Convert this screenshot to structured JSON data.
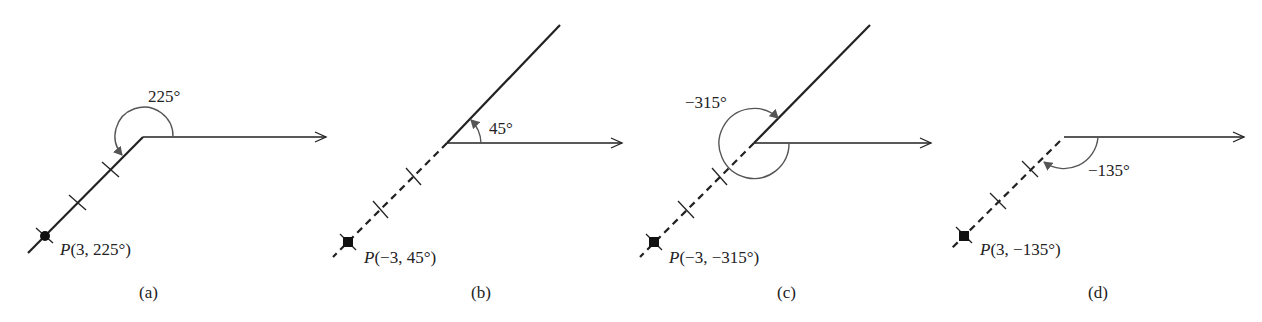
{
  "figure": {
    "panels": [
      {
        "id": "a",
        "caption": "(a)",
        "angle_label": "225°",
        "point_label_prefix": "P",
        "point_label_coords": "(3, 225°)",
        "r": 3,
        "theta_deg": 225,
        "terminal_side": "solid"
      },
      {
        "id": "b",
        "caption": "(b)",
        "angle_label": "45°",
        "point_label_prefix": "P",
        "point_label_coords": "(−3, 45°)",
        "r": -3,
        "theta_deg": 45,
        "terminal_side": "solid with dashed extension"
      },
      {
        "id": "c",
        "caption": "(c)",
        "angle_label": "−315°",
        "point_label_prefix": "P",
        "point_label_coords": "(−3, −315°)",
        "r": -3,
        "theta_deg": -315,
        "terminal_side": "solid with dashed extension"
      },
      {
        "id": "d",
        "caption": "(d)",
        "angle_label": "−135°",
        "point_label_prefix": "P",
        "point_label_coords": "(3, −135°)",
        "r": 3,
        "theta_deg": -135,
        "terminal_side": "dashed"
      }
    ]
  },
  "colors": {
    "ink": "#222222",
    "arc": "#555555",
    "background": "#ffffff"
  }
}
